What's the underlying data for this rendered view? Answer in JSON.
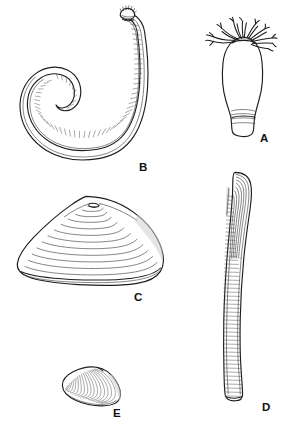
{
  "plate": {
    "title": "Marine invertebrate specimen plate",
    "background_color": "#ffffff",
    "ink_color": "#1d1d1d",
    "width": 299,
    "height": 431,
    "style": "black-and-white scientific line drawing"
  },
  "figures": [
    {
      "key": "A",
      "label": "A",
      "name": "tentacled-sac-organism",
      "description": "Flask-shaped body with a crown of about ten branched feeding tentacles at the top and transverse band lines near the truncated base",
      "position": "upper-right",
      "label_position": {
        "x": 260,
        "y": 133
      }
    },
    {
      "key": "B",
      "label": "B",
      "name": "elongate-hooked-worm",
      "description": "Long J-hooked vermiform body with ladder-like transverse segmentation and a small tufted crown at the free upper end",
      "position": "upper-left",
      "label_position": {
        "x": 139,
        "y": 162
      }
    },
    {
      "key": "C",
      "label": "C",
      "name": "large-bivalve-shell",
      "description": "Broad triangular-oval clam valve with nested concentric growth rings radiating from a central umbo",
      "position": "middle-left",
      "label_position": {
        "x": 134,
        "y": 292
      }
    },
    {
      "key": "D",
      "label": "D",
      "name": "razor-clam-shell",
      "description": "Tall narrow razor-shell valve with rounded top, longitudinal ridges and dense fine transverse striations",
      "position": "right-column",
      "label_position": {
        "x": 262,
        "y": 402
      }
    },
    {
      "key": "E",
      "label": "E",
      "name": "small-bivalve-shell",
      "description": "Small oblique clam valve with closely spaced concentric ribs and a shaded posterior margin",
      "position": "lower-left",
      "label_position": {
        "x": 113,
        "y": 408
      }
    }
  ]
}
